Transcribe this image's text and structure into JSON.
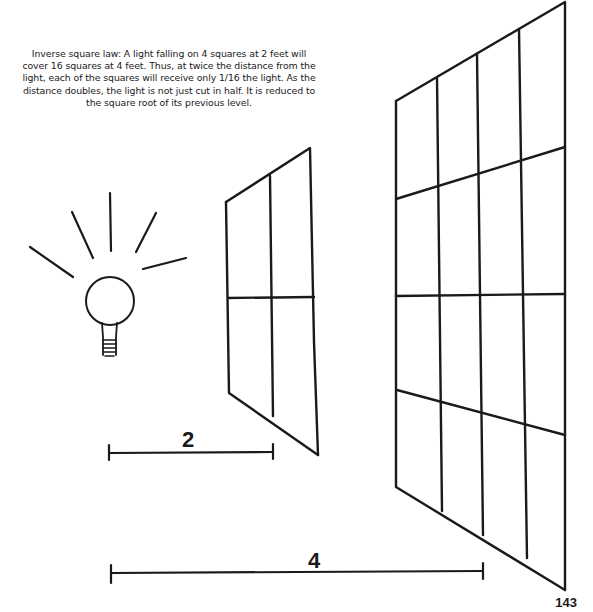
{
  "caption": "Inverse square law: A light falling on 4 squares at 2 feet will cover 16 squares at 4 feet. Thus, at twice the distance from the light, each of the squares will receive only 1/16 the light. As the distance doubles, the light is not just cut in half. It is reduced to the square root of its previous level.",
  "diagram": {
    "light_source": "light-bulb-icon",
    "near_panel": {
      "grid": "2x2",
      "squares": 4
    },
    "far_panel": {
      "grid": "4x4",
      "squares": 16
    },
    "distance_near_label": "2",
    "distance_far_label": "4"
  },
  "page_number": "143",
  "colors": {
    "ink": "#1a1a1a",
    "background": "#ffffff"
  }
}
